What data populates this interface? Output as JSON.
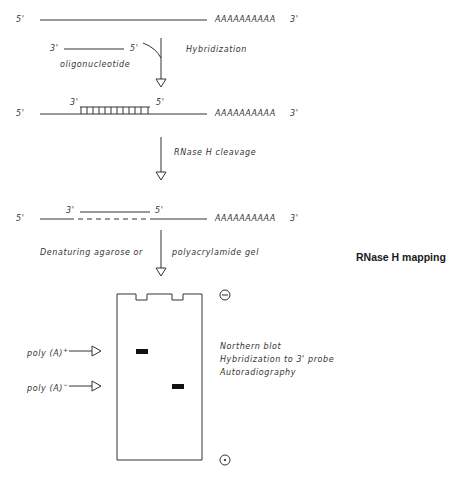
{
  "figure": {
    "title": "RNase H mapping",
    "stages": [
      {
        "name": "mrna",
        "five_prime": "5'",
        "poly_a": "AAAAAAAAAA",
        "three_prime": "3'"
      },
      {
        "name": "oligonucleotide",
        "three_prime": "3'",
        "five_prime": "5'",
        "label": "oligonucleotide"
      },
      {
        "name": "hybrid",
        "five_prime": "5'",
        "oligo_three_prime": "3'",
        "oligo_five_prime": "5'",
        "poly_a": "AAAAAAAAAA",
        "three_prime": "3'"
      },
      {
        "name": "cleaved",
        "five_prime": "5'",
        "oligo_three_prime": "3'",
        "oligo_five_prime": "5'",
        "poly_a": "AAAAAAAAAA",
        "three_prime": "3'"
      }
    ],
    "steps": [
      {
        "label": "Hybridization"
      },
      {
        "label": "RNase H cleavage"
      },
      {
        "label_left": "Denaturing agarose or",
        "label_right": "polyacrylamide gel"
      }
    ],
    "gel": {
      "negative_electrode": "-",
      "positive_electrode": "+",
      "bands": [
        {
          "label": "poly (A)",
          "superscript": "+"
        },
        {
          "label": "poly (A)",
          "superscript": "−"
        }
      ],
      "notes": [
        "Northern blot",
        "Hybridization to 3' probe",
        "Autoradiography"
      ]
    }
  }
}
